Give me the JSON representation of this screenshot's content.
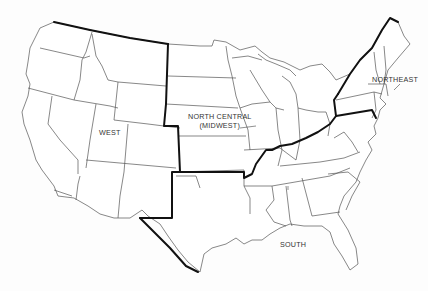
{
  "map": {
    "title": "United States Census Regions",
    "regions": [
      {
        "id": "west",
        "label": "WEST"
      },
      {
        "id": "north-central",
        "label_line1": "NORTH CENTRAL",
        "label_line2": "(MIDWEST)"
      },
      {
        "id": "northeast",
        "label": "NORTHEAST"
      },
      {
        "id": "south",
        "label": "SOUTH"
      }
    ],
    "colors": {
      "state_line": "#555555",
      "region_border": "#111111",
      "background": "#ffffff"
    }
  }
}
